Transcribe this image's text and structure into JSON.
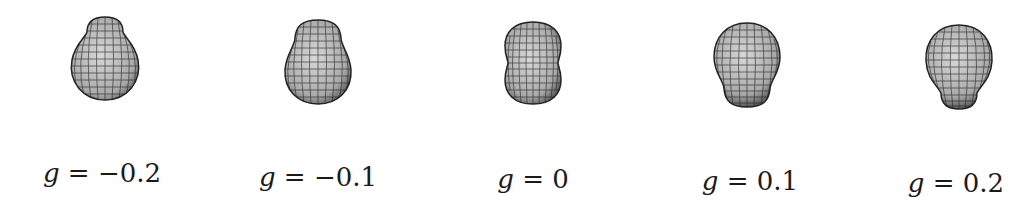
{
  "figure": {
    "panels": [
      {
        "variable": "g",
        "equals": "=",
        "value": "−0.2",
        "shape": "pear-top-narrow",
        "cx": 105,
        "label_x": 102,
        "label_top": 158
      },
      {
        "variable": "g",
        "equals": "=",
        "value": "−0.1",
        "shape": "pear-top-neck",
        "cx": 318,
        "label_x": 318,
        "label_top": 162
      },
      {
        "variable": "g",
        "equals": "=",
        "value": "0",
        "shape": "peanut",
        "cx": 533,
        "label_x": 533,
        "label_top": 164
      },
      {
        "variable": "g",
        "equals": "=",
        "value": "0.1",
        "shape": "pear-bottom-neck",
        "cx": 747,
        "label_x": 750,
        "label_top": 166
      },
      {
        "variable": "g",
        "equals": "=",
        "value": "0.2",
        "shape": "pear-bottom-narrow",
        "cx": 958,
        "label_x": 956,
        "label_top": 168
      }
    ]
  }
}
